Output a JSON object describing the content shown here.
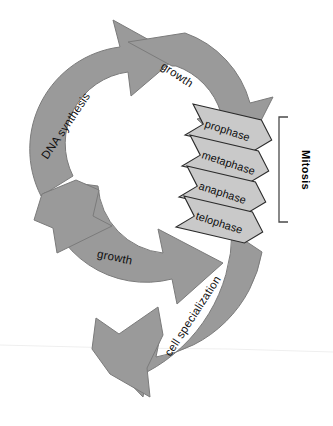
{
  "diagram": {
    "background_color": "#ffffff",
    "arrow_fill": "#9a9a9a",
    "arrow_stroke": "#6e6e6e",
    "chevron_fill": "#c9c9c9",
    "chevron_stroke": "#2b2b2b",
    "bracket_color": "#4a4a4a",
    "text_color": "#101010"
  },
  "cycle_labels": {
    "growth_top": "growth",
    "dna_synthesis": "DNA synthesis",
    "growth_bottom": "growth",
    "cell_specialization": "cell specialization"
  },
  "mitosis": {
    "bracket_label": "Mitosis",
    "phases": [
      {
        "label": "prophase"
      },
      {
        "label": "metaphase"
      },
      {
        "label": "anaphase"
      },
      {
        "label": "telophase"
      }
    ]
  }
}
